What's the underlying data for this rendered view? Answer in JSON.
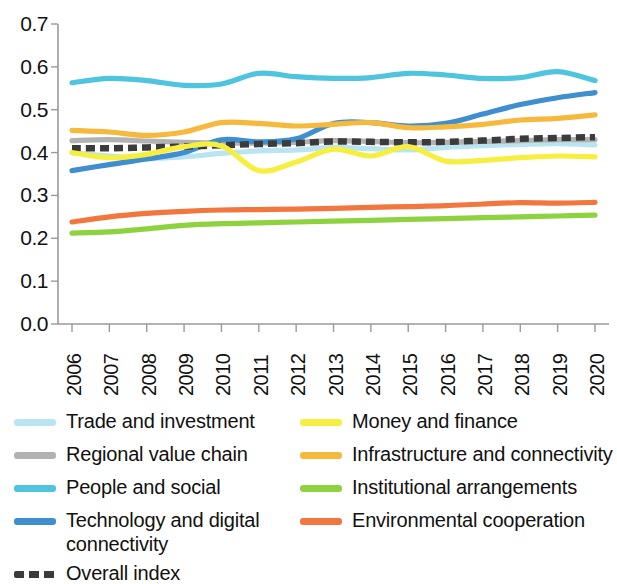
{
  "chart_data": {
    "type": "line",
    "title": "",
    "subtitle": "",
    "xlabel": "",
    "ylabel": "",
    "grid": false,
    "legend_position": "bottom",
    "x": [
      "2006",
      "2007",
      "2008",
      "2009",
      "2010",
      "2011",
      "2012",
      "2013",
      "2014",
      "2015",
      "2016",
      "2017",
      "2018",
      "2019",
      "2020"
    ],
    "xlim": [
      2006,
      2020
    ],
    "ylim": [
      0.0,
      0.7
    ],
    "ytick_labels": [
      "0.0",
      "0.1",
      "0.2",
      "0.3",
      "0.4",
      "0.5",
      "0.6",
      "0.7"
    ],
    "ytick_values": [
      0.0,
      0.1,
      0.2,
      0.3,
      0.4,
      0.5,
      0.6,
      0.7
    ],
    "series": [
      {
        "name": "Trade and investment",
        "color": "#b9e4f2",
        "style": "solid",
        "values": [
          0.4,
          0.392,
          0.386,
          0.39,
          0.398,
          0.404,
          0.406,
          0.412,
          0.409,
          0.406,
          0.412,
          0.416,
          0.419,
          0.421,
          0.418
        ]
      },
      {
        "name": "Regional value chain",
        "color": "#b2b2b2",
        "style": "solid",
        "values": [
          0.428,
          0.43,
          0.427,
          0.424,
          0.422,
          0.422,
          0.424,
          0.428,
          0.426,
          0.423,
          0.424,
          0.426,
          0.428,
          0.43,
          0.43
        ]
      },
      {
        "name": "People and social",
        "color": "#4fc4de",
        "style": "solid",
        "values": [
          0.563,
          0.573,
          0.568,
          0.557,
          0.56,
          0.585,
          0.577,
          0.573,
          0.575,
          0.585,
          0.581,
          0.573,
          0.575,
          0.589,
          0.568
        ]
      },
      {
        "name": "Technology and digital connectivity",
        "color": "#3e8ed0",
        "style": "solid",
        "values": [
          0.358,
          0.372,
          0.385,
          0.4,
          0.43,
          0.425,
          0.432,
          0.468,
          0.47,
          0.462,
          0.468,
          0.49,
          0.512,
          0.528,
          0.54
        ]
      },
      {
        "name": "Overall index",
        "color": "#3b3b3b",
        "style": "dashed",
        "values": [
          0.41,
          0.41,
          0.412,
          0.414,
          0.417,
          0.42,
          0.422,
          0.426,
          0.425,
          0.424,
          0.425,
          0.428,
          0.432,
          0.434,
          0.436
        ]
      },
      {
        "name": "Money and finance",
        "color": "#f6ef3f",
        "style": "solid",
        "values": [
          0.4,
          0.388,
          0.396,
          0.414,
          0.416,
          0.358,
          0.378,
          0.408,
          0.392,
          0.414,
          0.38,
          0.382,
          0.388,
          0.392,
          0.39
        ]
      },
      {
        "name": "Infrastructure and connectivity",
        "color": "#f5ba3d",
        "style": "solid",
        "values": [
          0.452,
          0.448,
          0.44,
          0.448,
          0.47,
          0.468,
          0.462,
          0.466,
          0.47,
          0.458,
          0.46,
          0.466,
          0.476,
          0.48,
          0.488
        ]
      },
      {
        "name": "Institutional arrangements",
        "color": "#8ed240",
        "style": "solid",
        "values": [
          0.212,
          0.215,
          0.222,
          0.23,
          0.234,
          0.236,
          0.238,
          0.24,
          0.242,
          0.244,
          0.246,
          0.248,
          0.25,
          0.252,
          0.254
        ]
      },
      {
        "name": "Environmental cooperation",
        "color": "#f2773f",
        "style": "solid",
        "values": [
          0.238,
          0.25,
          0.258,
          0.263,
          0.266,
          0.267,
          0.268,
          0.27,
          0.272,
          0.274,
          0.276,
          0.28,
          0.283,
          0.282,
          0.284
        ]
      }
    ]
  },
  "legend": {
    "left_column": [
      {
        "label": "Trade and investment",
        "color": "#b9e4f2",
        "style": "solid"
      },
      {
        "label": "Regional value chain",
        "color": "#b2b2b2",
        "style": "solid"
      },
      {
        "label": "People and social",
        "color": "#4fc4de",
        "style": "solid"
      },
      {
        "label": "Technology and digital connectivity",
        "color": "#3e8ed0",
        "style": "solid"
      },
      {
        "label": "Overall index",
        "color": "#3b3b3b",
        "style": "dashed"
      }
    ],
    "right_column": [
      {
        "label": "Money and finance",
        "color": "#f6ef3f",
        "style": "solid"
      },
      {
        "label": "Infrastructure and connectivity",
        "color": "#f5ba3d",
        "style": "solid"
      },
      {
        "label": "Institutional arrangements",
        "color": "#8ed240",
        "style": "solid"
      },
      {
        "label": "Environmental cooperation",
        "color": "#f2773f",
        "style": "solid"
      }
    ]
  },
  "axis": {
    "color": "#9a9a9a"
  }
}
